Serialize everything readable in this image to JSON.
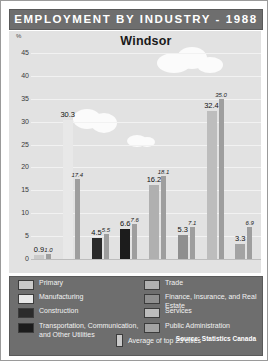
{
  "header": {
    "title": "EMPLOYMENT BY INDUSTRY - 1988"
  },
  "source": "Source: Statistics Canada",
  "legend": {
    "average_label": "Average of top 23 cities",
    "entries": [
      {
        "label": "Primary",
        "color": "#c9c9c9"
      },
      {
        "label": "Manufacturing",
        "color": "#e8e8e8"
      },
      {
        "label": "Construction",
        "color": "#2b2b2b"
      },
      {
        "label": "Transportation, Communication, and Other Utilities",
        "color": "#1c1c1c"
      },
      {
        "label": "Trade",
        "color": "#b0b0b0"
      },
      {
        "label": "Finance, Insurance, and Real Estate",
        "color": "#8f8f8f"
      },
      {
        "label": "Services",
        "color": "#bdbdbd"
      },
      {
        "label": "Public Administration",
        "color": "#a3a3a3"
      }
    ]
  },
  "chart_data": {
    "type": "bar",
    "title": "EMPLOYMENT BY INDUSTRY - 1988",
    "subtitle": "Windsor",
    "xlabel": "",
    "ylabel": "%",
    "ylim": [
      0,
      45
    ],
    "yticks": [
      "0",
      "5",
      "10",
      "15",
      "20",
      "25",
      "30",
      "35",
      "40",
      "45"
    ],
    "grid": true,
    "legend_position": "bottom",
    "categories": [
      "Primary",
      "Manufacturing",
      "Construction",
      "Transportation, Communication, and Other Utilities",
      "Trade",
      "Finance, Insurance, and Real Estate",
      "Services",
      "Public Administration"
    ],
    "series": [
      {
        "name": "Windsor",
        "values": [
          0.9,
          30.3,
          4.5,
          6.6,
          16.2,
          5.3,
          32.4,
          3.3
        ],
        "labels": [
          "0.9",
          "30.3",
          "4.5",
          "6.6",
          "16.2",
          "5.3",
          "32.4",
          "3.3"
        ],
        "colors": [
          "#c9c9c9",
          "#e8e8e8",
          "#2b2b2b",
          "#1c1c1c",
          "#b0b0b0",
          "#8f8f8f",
          "#bdbdbd",
          "#a3a3a3"
        ]
      },
      {
        "name": "Average of top 23 cities",
        "values": [
          1.0,
          17.4,
          5.5,
          7.6,
          18.1,
          7.1,
          35.0,
          6.9
        ],
        "labels": [
          "1.0",
          "17.4",
          "5.5",
          "7.6",
          "18.1",
          "7.1",
          "35.0",
          "6.9"
        ],
        "color": "#9e9e9e"
      }
    ]
  },
  "clouds": [
    {
      "x": 148,
      "y": 22,
      "w": 34,
      "h": 20
    },
    {
      "x": 168,
      "y": 16,
      "w": 30,
      "h": 22
    },
    {
      "x": 188,
      "y": 26,
      "w": 26,
      "h": 16
    },
    {
      "x": 64,
      "y": 78,
      "w": 28,
      "h": 20
    },
    {
      "x": 82,
      "y": 82,
      "w": 26,
      "h": 20
    },
    {
      "x": 118,
      "y": 104,
      "w": 20,
      "h": 12
    },
    {
      "x": 130,
      "y": 106,
      "w": 16,
      "h": 10
    }
  ]
}
